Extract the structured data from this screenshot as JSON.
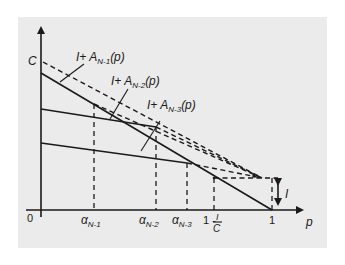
{
  "figure": {
    "axes": {
      "y_label": "C",
      "x_label": "p",
      "origin_label": "0",
      "x_end_label": "1"
    },
    "curve_labels": [
      {
        "prefix": "I+ A",
        "subscript": "N-1",
        "suffix": "(p)"
      },
      {
        "prefix": "I+ A",
        "subscript": "N-2",
        "suffix": "(p)"
      },
      {
        "prefix": "I+ A",
        "subscript": "N-3",
        "suffix": "(p)"
      }
    ],
    "x_ticks": [
      {
        "symbol": "α",
        "subscript": "N-1"
      },
      {
        "symbol": "α",
        "subscript": "N-2"
      },
      {
        "symbol": "α",
        "subscript": "N-3"
      },
      {
        "prefix": "1 -",
        "numerator": "I",
        "denominator": "C"
      }
    ],
    "gap_label": "I",
    "colors": {
      "panel": "#ebebeb",
      "ink": "#1a1a1a",
      "page": "#ffffff"
    }
  }
}
